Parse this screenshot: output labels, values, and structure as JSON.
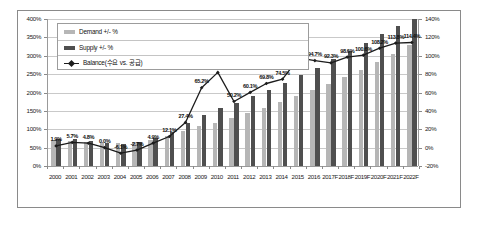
{
  "chart_data": {
    "type": "bar",
    "title": "",
    "subtitle": "",
    "xlabel": "",
    "ylabel": "",
    "grid": true,
    "legend_position": "top-left",
    "categories": [
      "2000",
      "2001",
      "2002",
      "2003",
      "2004",
      "2005",
      "2006",
      "2007",
      "2008",
      "2009",
      "2010",
      "2011",
      "2012",
      "2013",
      "2014",
      "2015",
      "2016",
      "2017F",
      "2018F",
      "2019F",
      "2020F",
      "2021F",
      "2022F"
    ],
    "axes": {
      "left": {
        "label": "",
        "ylim": [
          0,
          400
        ],
        "unit": "%",
        "ticks": [
          "0%",
          "50%",
          "100%",
          "150%",
          "200%",
          "250%",
          "300%",
          "350%",
          "400%"
        ],
        "tick_values": [
          0,
          50,
          100,
          150,
          200,
          250,
          300,
          350,
          400
        ],
        "series_using_axis": [
          "Demand +/- %",
          "Supply +/- %"
        ]
      },
      "right": {
        "label": "",
        "ylim": [
          -20,
          140
        ],
        "unit": "%",
        "ticks": [
          "-20%",
          "0%",
          "20%",
          "40%",
          "60%",
          "80%",
          "100%",
          "120%",
          "140%"
        ],
        "tick_values": [
          -20,
          0,
          20,
          40,
          60,
          80,
          100,
          120,
          140
        ],
        "series_using_axis": [
          "Balance(수요 vs. 공급)"
        ]
      }
    },
    "series": [
      {
        "name": "Demand +/- %",
        "type": "bar",
        "color": "#b6b6b6",
        "axis": "left",
        "values": [
          72,
          69,
          66,
          63,
          63,
          66,
          72,
          83,
          96,
          108,
          118,
          131,
          145,
          158,
          173,
          190,
          206,
          223,
          242,
          262,
          284,
          305,
          330
        ]
      },
      {
        "name": "Supply +/- %",
        "type": "bar",
        "color": "#4f4f4f",
        "axis": "left",
        "values": [
          74,
          73,
          69,
          63,
          59,
          64,
          76,
          93,
          116,
          139,
          158,
          172,
          190,
          206,
          225,
          248,
          268,
          290,
          312,
          336,
          360,
          381,
          400
        ]
      },
      {
        "name": "Balance(수요 vs. 공급)",
        "type": "line",
        "color": "#1c1c1c",
        "axis": "right",
        "values": [
          1.9,
          5.7,
          4.8,
          0.0,
          -6.1,
          -2.7,
          4.9,
          12.1,
          27.4,
          65.2,
          81.9,
          50.2,
          60.1,
          69.8,
          74.5,
          97.6,
          94.7,
          92.3,
          98.6,
          100.6,
          108.2,
          113.8,
          114.4
        ],
        "data_labels": [
          "1.9%",
          "5.7%",
          "4.8%",
          "0.0%",
          "-6.1%",
          "-2.7%",
          "4.9%",
          "12.1%",
          "27.4%",
          "65.2%",
          "81.9%",
          "50.2%",
          "60.1%",
          "69.8%",
          "74.5%",
          "97.6%",
          "94.7%",
          "92.3%",
          "98.6%",
          "100.6%",
          "108.2%",
          "113.8%",
          "114.4%"
        ]
      }
    ]
  },
  "legend": {
    "items": [
      {
        "label": "Demand +/- %",
        "marker": "swatch-light-gray"
      },
      {
        "label": "Supply +/- %",
        "marker": "swatch-dark-gray"
      },
      {
        "label": "Balance(수요 vs. 공급)",
        "marker": "line-diamond-marker"
      }
    ]
  },
  "colors": {
    "demand": "#b6b6b6",
    "supply": "#4f4f4f",
    "balance_line": "#1c1c1c",
    "gridline": "#c9c9c9",
    "frame": "#8a8a8a",
    "background": "#ffffff"
  }
}
